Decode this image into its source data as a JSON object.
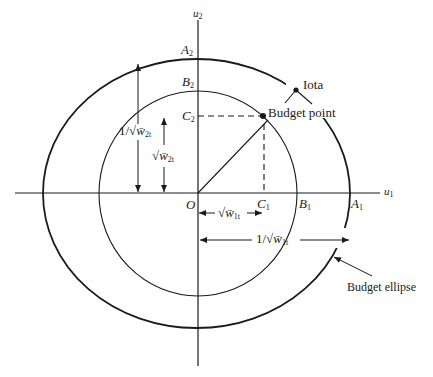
{
  "axes": {
    "x_label": {
      "base": "u",
      "sub": "1"
    },
    "y_label": {
      "base": "u",
      "sub": "2"
    },
    "origin_label": "O"
  },
  "points": {
    "A1": {
      "base": "A",
      "sub": "1"
    },
    "A2": {
      "base": "A",
      "sub": "2"
    },
    "B1": {
      "base": "B",
      "sub": "1"
    },
    "B2": {
      "base": "B",
      "sub": "2"
    },
    "C1": {
      "base": "C",
      "sub": "1"
    },
    "C2": {
      "base": "C",
      "sub": "2"
    }
  },
  "annotations": {
    "iota": "Iota",
    "budget_point": "Budget point",
    "budget_ellipse": "Budget ellipse"
  },
  "measures": {
    "inv_sqrt_w2t": {
      "prefix": "1/√",
      "var": "w̄",
      "sub": "2t"
    },
    "sqrt_w2t": {
      "prefix": "√",
      "var": "w̄",
      "sub": "2t"
    },
    "sqrt_w1t": {
      "prefix": "√",
      "var": "w̄",
      "sub": "1t"
    },
    "inv_sqrt_w1t": {
      "prefix": "1/√",
      "var": "w̄",
      "sub": "1t"
    }
  },
  "colors": {
    "ink": "#1a1a1a",
    "background": "#ffffff"
  }
}
